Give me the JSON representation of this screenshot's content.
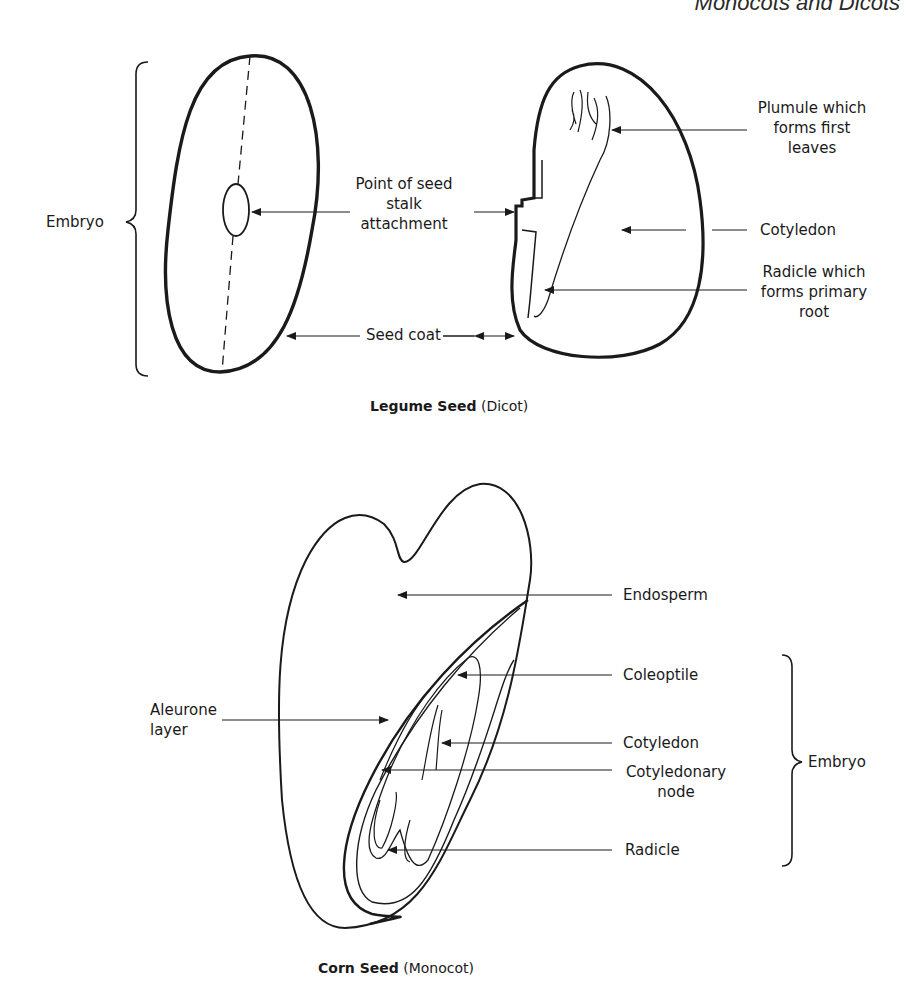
{
  "header": {
    "title": "Monocots and Dicots"
  },
  "dicot": {
    "caption_bold": "Legume Seed",
    "caption_rest": " (Dicot)",
    "labels": {
      "embryo": "Embryo",
      "point_of_seed_stalk_attachment": [
        "Point of seed",
        "stalk",
        "attachment"
      ],
      "seed_coat": "Seed coat",
      "plumule": [
        "Plumule which",
        "forms first",
        "leaves"
      ],
      "cotyledon": "Cotyledon",
      "radicle": [
        "Radicle which",
        "forms primary",
        "root"
      ]
    }
  },
  "monocot": {
    "caption_bold": "Corn Seed",
    "caption_rest": " (Monocot)",
    "labels": {
      "endosperm": "Endosperm",
      "coleoptile": "Coleoptile",
      "aleurone_layer": [
        "Aleurone",
        "layer"
      ],
      "cotyledon": "Cotyledon",
      "cotyledonary_node": [
        "Cotyledonary",
        "node"
      ],
      "radicle": "Radicle",
      "embryo": "Embryo"
    }
  }
}
